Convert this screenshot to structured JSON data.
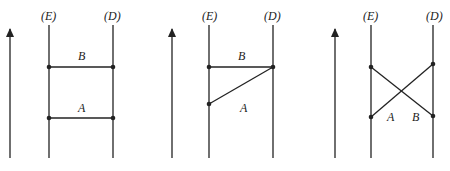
{
  "diagrams": [
    {
      "worldlines": {
        "left": "(E)",
        "right": "(D)"
      },
      "events": [
        {
          "label": "B"
        },
        {
          "label": "A"
        }
      ]
    },
    {
      "worldlines": {
        "left": "(E)",
        "right": "(D)"
      },
      "events": [
        {
          "label": "B"
        },
        {
          "label": "A"
        }
      ]
    },
    {
      "worldlines": {
        "left": "(E)",
        "right": "(D)"
      },
      "events": [
        {
          "label": "A"
        },
        {
          "label": "B"
        }
      ]
    }
  ],
  "colors": {
    "ink": "#222222",
    "background": "#ffffff"
  }
}
